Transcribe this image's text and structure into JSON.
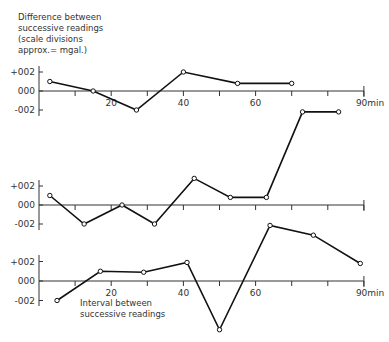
{
  "title_lines": [
    "Difference between",
    "successive readings",
    "(scale divisions",
    " approx.= mgal.)"
  ],
  "annotation_lines": [
    "Interval between",
    "successive readings"
  ],
  "chart_data": [
    {
      "type": "line",
      "name": "top",
      "ylabel": "Difference between successive readings (scale divisions approx.= mgal.)",
      "xlabel": "min",
      "yticks": [
        "+002",
        "000",
        "-002"
      ],
      "xtick_labels": [
        "20",
        "40",
        "60",
        "90min"
      ],
      "xlim": [
        0,
        90
      ],
      "x": [
        3,
        15,
        27,
        40,
        55,
        70
      ],
      "values": [
        0.01,
        0.0,
        -0.02,
        0.02,
        0.008,
        0.008
      ]
    },
    {
      "type": "line",
      "name": "middle",
      "xlabel": "min",
      "yticks": [
        "+002",
        "000",
        "-002"
      ],
      "xlim": [
        0,
        90
      ],
      "x": [
        3,
        12.5,
        23,
        32,
        43,
        53,
        63,
        73,
        83
      ],
      "values": [
        0.01,
        -0.02,
        0.0,
        -0.02,
        0.028,
        0.008,
        0.008,
        0.098,
        0.098
      ]
    },
    {
      "type": "line",
      "name": "bottom",
      "xlabel": "Interval between successive readings",
      "yticks": [
        "+002",
        "000",
        "-002"
      ],
      "xtick_labels": [
        "20",
        "40",
        "60",
        "90min"
      ],
      "xlim": [
        0,
        90
      ],
      "x": [
        5,
        17,
        29,
        41,
        50,
        64,
        76,
        89
      ],
      "values": [
        -0.02,
        0.01,
        0.009,
        0.019,
        -0.05,
        0.057,
        0.047,
        0.018
      ]
    }
  ],
  "panels": [
    {
      "y_plus": "+002",
      "y_zero": "000",
      "y_minus": "-002"
    },
    {
      "y_plus": "+002",
      "y_zero": "000",
      "y_minus": "-002"
    },
    {
      "y_plus": "+002",
      "y_zero": "000",
      "y_minus": "-002"
    }
  ],
  "x_labels": {
    "t20": "20",
    "t40": "40",
    "t60": "60",
    "t90": "90min"
  }
}
